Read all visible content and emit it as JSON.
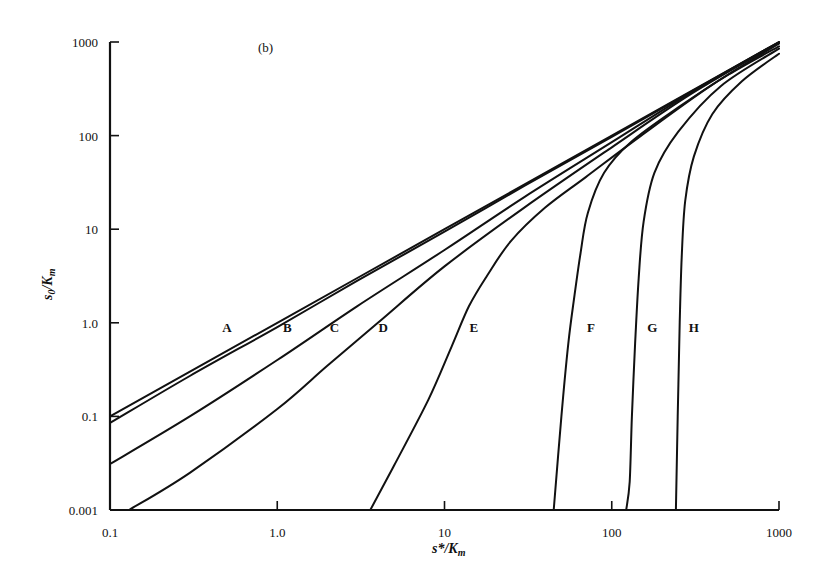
{
  "panel_label": "(b)",
  "chart_data": {
    "type": "line",
    "title": "",
    "panel": "(b)",
    "xlabel": "s*/K_m",
    "ylabel": "s_0/K_m",
    "xscale": "log",
    "yscale": "log",
    "xlim": [
      0.1,
      1000
    ],
    "ylim": [
      0.01,
      1000
    ],
    "x_ticks": [
      {
        "value": 0.1,
        "label": "0.1"
      },
      {
        "value": 1,
        "label": "1.0"
      },
      {
        "value": 10,
        "label": "10"
      },
      {
        "value": 100,
        "label": "100"
      },
      {
        "value": 1000,
        "label": "1000"
      }
    ],
    "y_ticks": [
      {
        "value": 0.01,
        "label": "0.001"
      },
      {
        "value": 0.1,
        "label": "0.1"
      },
      {
        "value": 1,
        "label": "1.0"
      },
      {
        "value": 10,
        "label": "10"
      },
      {
        "value": 100,
        "label": "100"
      },
      {
        "value": 1000,
        "label": "1000"
      }
    ],
    "grid": false,
    "legend": "inline curve labels along y = 1.0",
    "series": [
      {
        "name": "A",
        "label_pos": [
          0.5,
          1.0
        ],
        "points": [
          [
            0.1,
            0.1
          ],
          [
            1,
            1.0
          ],
          [
            10,
            10
          ],
          [
            100,
            100
          ],
          [
            1000,
            1000
          ]
        ]
      },
      {
        "name": "B",
        "label_pos": [
          1.15,
          1.0
        ],
        "points": [
          [
            0.1,
            0.085
          ],
          [
            0.3,
            0.27
          ],
          [
            1,
            0.9
          ],
          [
            3,
            2.8
          ],
          [
            10,
            9.4
          ],
          [
            30,
            29
          ],
          [
            100,
            97
          ],
          [
            1000,
            1000
          ]
        ]
      },
      {
        "name": "C",
        "label_pos": [
          2.2,
          1.0
        ],
        "points": [
          [
            0.1,
            0.031
          ],
          [
            0.3,
            0.1
          ],
          [
            1,
            0.4
          ],
          [
            3,
            1.5
          ],
          [
            10,
            6.0
          ],
          [
            30,
            22
          ],
          [
            100,
            85
          ],
          [
            300,
            290
          ],
          [
            1000,
            990
          ]
        ]
      },
      {
        "name": "D",
        "label_pos": [
          4.3,
          1.0
        ],
        "points": [
          [
            0.13,
            0.01
          ],
          [
            0.3,
            0.025
          ],
          [
            1,
            0.12
          ],
          [
            2,
            0.35
          ],
          [
            4,
            1.0
          ],
          [
            10,
            4.0
          ],
          [
            30,
            17
          ],
          [
            100,
            75
          ],
          [
            300,
            280
          ],
          [
            1000,
            980
          ]
        ]
      },
      {
        "name": "E",
        "label_pos": [
          15,
          1.0
        ],
        "points": [
          [
            3.6,
            0.01
          ],
          [
            5,
            0.03
          ],
          [
            8,
            0.15
          ],
          [
            11,
            0.55
          ],
          [
            14,
            1.5
          ],
          [
            18,
            3.2
          ],
          [
            25,
            7.5
          ],
          [
            40,
            17
          ],
          [
            70,
            36
          ],
          [
            150,
            100
          ],
          [
            400,
            350
          ],
          [
            1000,
            960
          ]
        ]
      },
      {
        "name": "F",
        "label_pos": [
          75,
          1.0
        ],
        "points": [
          [
            45,
            0.01
          ],
          [
            50,
            0.1
          ],
          [
            55,
            0.6
          ],
          [
            60,
            2.0
          ],
          [
            65,
            5.5
          ],
          [
            72,
            15
          ],
          [
            90,
            40
          ],
          [
            130,
            85
          ],
          [
            250,
            200
          ],
          [
            500,
            450
          ],
          [
            1000,
            900
          ]
        ]
      },
      {
        "name": "G",
        "label_pos": [
          175,
          1.0
        ],
        "points": [
          [
            122,
            0.01
          ],
          [
            128,
            0.02
          ],
          [
            132,
            0.1
          ],
          [
            138,
            0.6
          ],
          [
            145,
            3.0
          ],
          [
            155,
            12
          ],
          [
            180,
            40
          ],
          [
            250,
            110
          ],
          [
            450,
            340
          ],
          [
            1000,
            850
          ]
        ]
      },
      {
        "name": "H",
        "label_pos": [
          310,
          1.0
        ],
        "points": [
          [
            242,
            0.01
          ],
          [
            248,
            0.1
          ],
          [
            255,
            1.0
          ],
          [
            262,
            5.0
          ],
          [
            275,
            20
          ],
          [
            310,
            60
          ],
          [
            400,
            170
          ],
          [
            600,
            380
          ],
          [
            1000,
            750
          ]
        ]
      }
    ]
  }
}
